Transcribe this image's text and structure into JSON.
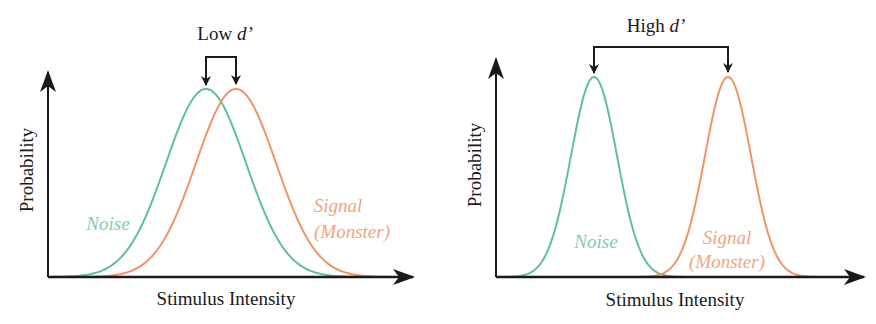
{
  "chart_data": [
    {
      "type": "line",
      "title": "Low d'",
      "title_prefix": "Low ",
      "title_symbol": "d'",
      "xlabel": "Stimulus Intensity",
      "ylabel": "Probability",
      "grid": false,
      "ticks": false,
      "series": [
        {
          "name": "Noise",
          "label_lines": [
            "Noise"
          ],
          "color": "#5fbf9f",
          "distribution": "normal",
          "mean": 206,
          "sd": 40,
          "peak_px": 188
        },
        {
          "name": "Signal (Monster)",
          "label_lines": [
            "Signal",
            "(Monster)"
          ],
          "color": "#f09468",
          "distribution": "normal",
          "mean": 236,
          "sd": 40,
          "peak_px": 188
        }
      ],
      "annotation": "Bracket arrows marking the two peaks; small separation (low sensitivity)"
    },
    {
      "type": "line",
      "title": "High d'",
      "title_prefix": "High ",
      "title_symbol": "d'",
      "xlabel": "Stimulus Intensity",
      "ylabel": "Probability",
      "grid": false,
      "ticks": false,
      "series": [
        {
          "name": "Noise",
          "label_lines": [
            "Noise"
          ],
          "color": "#5fbf9f",
          "distribution": "normal",
          "mean": 594,
          "sd": 23,
          "peak_px": 200
        },
        {
          "name": "Signal (Monster)",
          "label_lines": [
            "Signal",
            "(Monster)"
          ],
          "color": "#f09468",
          "distribution": "normal",
          "mean": 728,
          "sd": 23,
          "peak_px": 200
        }
      ],
      "annotation": "Bracket arrows marking the two peaks; large separation (high sensitivity)"
    }
  ],
  "panels": [
    {
      "title_prefix": "Low ",
      "title_symbol": "d’",
      "xlabel": "Stimulus Intensity",
      "ylabel": "Probability",
      "noise_label": "Noise",
      "signal_label_1": "Signal",
      "signal_label_2": "(Monster)"
    },
    {
      "title_prefix": "High ",
      "title_symbol": "d’",
      "xlabel": "Stimulus Intensity",
      "ylabel": "Probability",
      "noise_label": "Noise",
      "signal_label_1": "Signal",
      "signal_label_2": "(Monster)"
    }
  ],
  "colors": {
    "noise": "#5fbf9f",
    "signal": "#f09468",
    "axis": "#1a1a1a"
  }
}
